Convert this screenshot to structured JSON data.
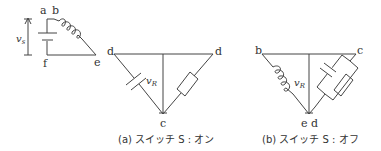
{
  "colors": {
    "line": "#444444",
    "text": "#333333",
    "background": "#ffffff"
  },
  "source_circuit": {
    "nodes": {
      "a": "a",
      "b": "b",
      "e": "e",
      "f": "f"
    },
    "voltage_label": "v",
    "voltage_sub": "s",
    "components": [
      "battery",
      "inductor"
    ]
  },
  "figure_a": {
    "nodes": {
      "left": "d",
      "right": "d",
      "bottom": "c"
    },
    "voltage_label": "v",
    "voltage_sub": "R",
    "components": [
      "capacitor",
      "resistor"
    ],
    "caption": "(a) スイッチ S : オン"
  },
  "figure_b": {
    "nodes": {
      "left": "b",
      "right": "c",
      "bottom": "e d"
    },
    "voltage_label": "v",
    "voltage_sub": "R",
    "components": [
      "inductor",
      "capacitor",
      "resistor"
    ],
    "caption": "(b) スイッチ S : オフ"
  }
}
